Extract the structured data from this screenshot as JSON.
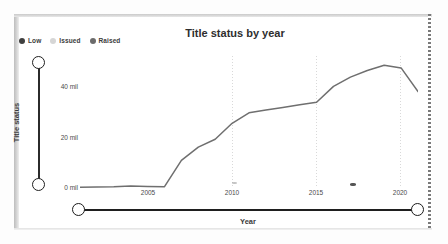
{
  "chart_data": {
    "type": "line",
    "title": "Title status by year",
    "xlabel": "Year",
    "ylabel": "Title status",
    "grid": "vertical-dotted",
    "legend_position": "top-left",
    "xlim": [
      2001,
      2021
    ],
    "ylim": [
      0,
      50
    ],
    "ytick_labels": [
      "0 mil",
      "20 mil",
      "40 mil"
    ],
    "ytick_values": [
      0,
      20,
      40
    ],
    "xtick_labels": [
      "2005",
      "2010",
      "2015",
      "2020"
    ],
    "xtick_values": [
      2005,
      2010,
      2015,
      2020
    ],
    "legend": [
      {
        "name": "Low",
        "color": "#3f3f3f"
      },
      {
        "name": "Issued",
        "color": "#c9c9c9"
      },
      {
        "name": "Raised",
        "color": "#6b6b6b"
      }
    ],
    "series": [
      {
        "name": "Low",
        "color": "#6f6f6f",
        "x": [
          2001,
          2002,
          2003,
          2004,
          2005,
          2006,
          2007,
          2008,
          2009,
          2010,
          2011,
          2012,
          2013,
          2014,
          2015,
          2016,
          2017,
          2018,
          2019,
          2020,
          2021
        ],
        "values": [
          0.3,
          0.4,
          0.5,
          0.8,
          0.6,
          0.5,
          10.5,
          15.5,
          18.5,
          24.5,
          28.5,
          29.5,
          30.5,
          31.5,
          32.5,
          38.5,
          42.0,
          44.5,
          46.5,
          45.5,
          36.5
        ]
      }
    ]
  },
  "legend": {
    "items": [
      {
        "label": "Low",
        "color": "#3f3f3f"
      },
      {
        "label": "Issued",
        "color": "#cfcfcf"
      },
      {
        "label": "Raised",
        "color": "#6b6b6b"
      }
    ]
  },
  "title": "Title status by year",
  "axes": {
    "y_title": "Title status",
    "x_title": "Year",
    "y_ticks": [
      "40 mil",
      "20 mil",
      "0 mil"
    ],
    "x_ticks": [
      "2005",
      "2010",
      "2015",
      "2020"
    ]
  },
  "sliders": {
    "vertical": {
      "name": "Title status",
      "low_handle": "min",
      "high_handle": "max"
    },
    "horizontal": {
      "name": "Year",
      "low_handle": "min",
      "high_handle": "max"
    }
  }
}
